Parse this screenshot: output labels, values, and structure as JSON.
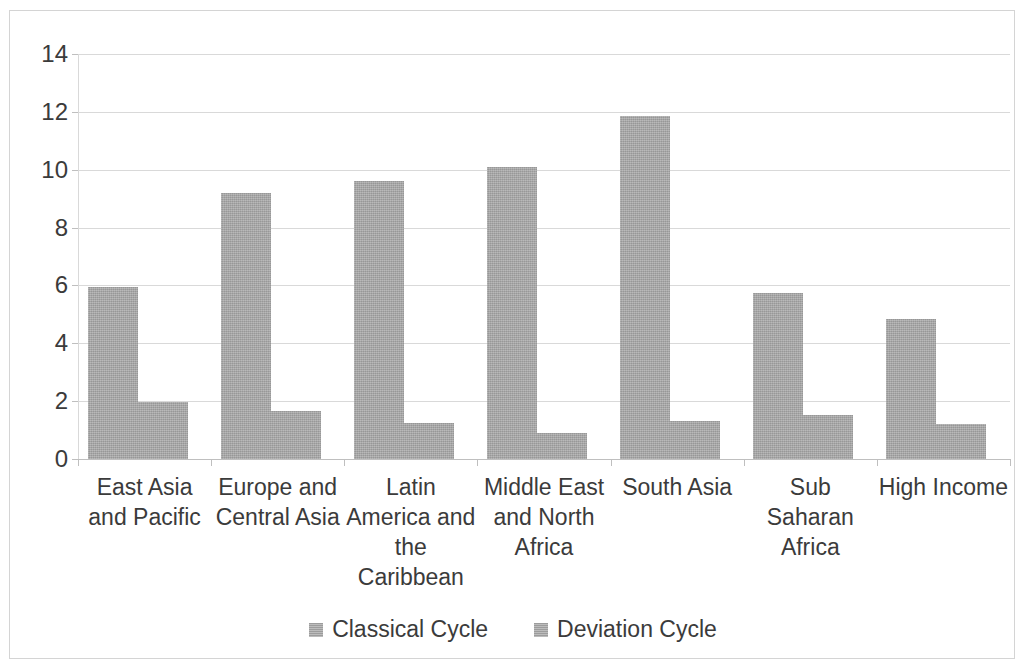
{
  "chart_data": {
    "type": "bar",
    "title": "",
    "subtitle": "",
    "xlabel": "",
    "ylabel": "",
    "ylim": [
      0,
      14
    ],
    "yticks": [
      0,
      2,
      4,
      6,
      8,
      10,
      12,
      14
    ],
    "ytick_labels": [
      "0",
      "2",
      "4",
      "6",
      "8",
      "10",
      "12",
      "14"
    ],
    "grid": true,
    "legend_position": "bottom",
    "bar_color": "#a6a6a6",
    "gridline_color": "#d9d9d9",
    "text_color": "#3b3b3b",
    "categories": [
      "East Asia and Pacific",
      "Europe and Central Asia",
      "Latin America and the Caribbean",
      "Middle East and North Africa",
      "South Asia",
      "Sub Saharan Africa",
      "High Income"
    ],
    "category_label_lines": [
      [
        "East Asia",
        "and Pacific"
      ],
      [
        "Europe and",
        "Central Asia"
      ],
      [
        "Latin",
        "America and",
        "the",
        "Caribbean"
      ],
      [
        "Middle East",
        "and North",
        "Africa"
      ],
      [
        "South Asia"
      ],
      [
        "Sub Saharan",
        "Africa"
      ],
      [
        "High Income"
      ]
    ],
    "series": [
      {
        "name": "Classical Cycle",
        "color": "#a6a6a6",
        "values": [
          5.93,
          9.2,
          9.6,
          10.1,
          11.85,
          5.75,
          4.85
        ]
      },
      {
        "name": "Deviation Cycle",
        "color": "#a6a6a6",
        "values": [
          1.97,
          1.66,
          1.25,
          0.9,
          1.3,
          1.52,
          1.2
        ]
      }
    ]
  },
  "legend": {
    "items": [
      {
        "label": "Classical Cycle"
      },
      {
        "label": "Deviation Cycle"
      }
    ]
  }
}
